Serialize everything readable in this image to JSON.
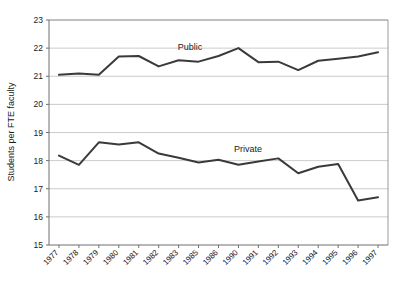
{
  "chart_data": {
    "type": "line",
    "title": "",
    "xlabel": "",
    "ylabel": "Students per FTE faculty",
    "ylim": [
      15,
      23
    ],
    "yticks": [
      15,
      16,
      17,
      18,
      19,
      20,
      21,
      22,
      23
    ],
    "grid": true,
    "legend_position": "inline-labels",
    "categories": [
      "1977",
      "1978",
      "1979",
      "1980",
      "1981",
      "1982",
      "1983",
      "1985",
      "1986",
      "1990",
      "1991",
      "1992",
      "1993",
      "1994",
      "1995",
      "1996",
      "1997"
    ],
    "series": [
      {
        "name": "Public",
        "color": "#3a3a3a",
        "label_x_category": "1982",
        "values": [
          21.05,
          21.1,
          21.05,
          21.7,
          21.72,
          21.35,
          21.57,
          21.52,
          21.72,
          22.0,
          21.5,
          21.52,
          21.22,
          21.55,
          21.62,
          21.7,
          21.85
        ]
      },
      {
        "name": "Private",
        "color": "#3a3a3a",
        "label_x_category": "1990",
        "values": [
          18.18,
          17.85,
          18.65,
          18.57,
          18.65,
          18.25,
          18.1,
          17.93,
          18.03,
          17.85,
          17.97,
          18.08,
          17.55,
          17.78,
          17.88,
          16.58,
          16.7
        ]
      }
    ],
    "annotations": [
      {
        "text": "Public",
        "x": 190,
        "y": 50
      },
      {
        "text": "Private",
        "x": 248,
        "y": 152
      }
    ]
  },
  "axes": {
    "y_title": "Students per FTE faculty",
    "y_tick_labels": [
      "23",
      "22",
      "21",
      "20",
      "19",
      "18",
      "17",
      "16",
      "15"
    ],
    "x_tick_labels": [
      "1977",
      "1978",
      "1979",
      "1980",
      "1981",
      "1982",
      "1983",
      "1985",
      "1986",
      "1990",
      "1991",
      "1992",
      "1993",
      "1994",
      "1995",
      "1996",
      "1997"
    ]
  },
  "series_labels": {
    "public": "Public",
    "private": "Private"
  },
  "colors": {
    "line": "#3a3a3a",
    "grid": "#b4b4b4",
    "axis": "#6e6e6e",
    "frame": "#9a9a9a",
    "background": "#ffffff",
    "text": "#1a1a1a"
  }
}
